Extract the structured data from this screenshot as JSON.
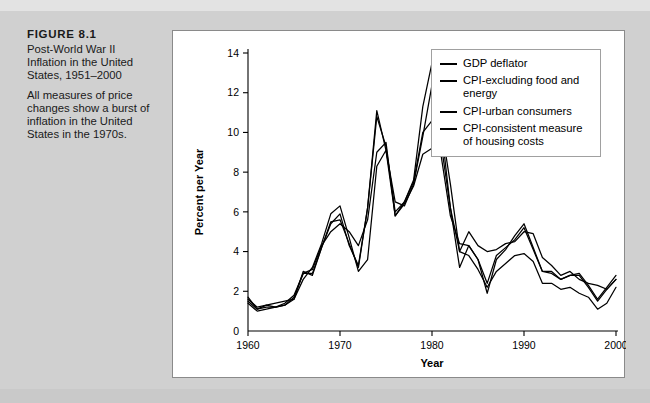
{
  "caption": {
    "figure_number": "FIGURE 8.1",
    "title": "Post-World War II Inflation in the United States, 1951–2000",
    "description": "All measures of price changes show a burst of inflation in the United States in the 1970s."
  },
  "chart_data": {
    "type": "line",
    "title": "",
    "xlabel": "Year",
    "ylabel": "Percent per Year",
    "xlim": [
      1960,
      2000
    ],
    "ylim": [
      0,
      14
    ],
    "xticks": [
      1960,
      1970,
      1980,
      1990,
      2000
    ],
    "yticks": [
      0,
      2,
      4,
      6,
      8,
      10,
      12,
      14
    ],
    "grid": false,
    "legend_position": "top-right",
    "x": [
      1960,
      1961,
      1962,
      1963,
      1964,
      1965,
      1966,
      1967,
      1968,
      1969,
      1970,
      1971,
      1972,
      1973,
      1974,
      1975,
      1976,
      1977,
      1978,
      1979,
      1980,
      1981,
      1982,
      1983,
      1984,
      1985,
      1986,
      1987,
      1988,
      1989,
      1990,
      1991,
      1992,
      1993,
      1994,
      1995,
      1996,
      1997,
      1998,
      1999,
      2000
    ],
    "series": [
      {
        "name": "GDP deflator",
        "values": [
          1.7,
          1.1,
          1.3,
          1.2,
          1.4,
          1.8,
          2.9,
          3.1,
          4.3,
          5.0,
          5.4,
          5.0,
          4.3,
          5.6,
          9.0,
          9.5,
          5.8,
          6.4,
          7.3,
          8.9,
          9.2,
          9.4,
          6.2,
          4.0,
          3.8,
          3.1,
          2.2,
          3.0,
          3.4,
          3.8,
          3.9,
          3.5,
          2.4,
          2.4,
          2.1,
          2.2,
          1.9,
          1.7,
          1.1,
          1.4,
          2.2
        ]
      },
      {
        "name": "CPI-excluding food and energy",
        "values": [
          1.6,
          1.2,
          1.3,
          1.4,
          1.5,
          1.6,
          2.6,
          3.2,
          4.4,
          5.9,
          6.3,
          4.7,
          3.0,
          3.6,
          8.3,
          9.1,
          6.5,
          6.3,
          7.4,
          9.8,
          12.4,
          10.4,
          7.4,
          4.0,
          5.0,
          4.3,
          4.0,
          4.1,
          4.4,
          4.5,
          5.0,
          4.9,
          3.7,
          3.3,
          2.8,
          3.0,
          2.6,
          2.4,
          2.3,
          2.1,
          2.6
        ]
      },
      {
        "name": "CPI-urban consumers",
        "values": [
          1.5,
          1.1,
          1.2,
          1.2,
          1.3,
          1.6,
          3.0,
          2.8,
          4.2,
          5.4,
          5.9,
          4.3,
          3.3,
          6.2,
          11.1,
          9.1,
          5.8,
          6.5,
          7.6,
          11.3,
          13.5,
          10.3,
          6.2,
          3.2,
          4.3,
          3.6,
          1.9,
          3.6,
          4.1,
          4.8,
          5.4,
          4.2,
          3.0,
          3.0,
          2.6,
          2.8,
          2.9,
          2.3,
          1.6,
          2.2,
          2.8
        ]
      },
      {
        "name": "CPI-consistent measure of housing costs",
        "values": [
          1.4,
          1.0,
          1.1,
          1.2,
          1.3,
          1.7,
          2.9,
          2.9,
          4.2,
          5.5,
          5.6,
          4.4,
          3.2,
          6.2,
          10.8,
          9.3,
          6.0,
          6.5,
          7.5,
          10.0,
          10.6,
          8.8,
          5.8,
          4.4,
          4.3,
          3.6,
          2.4,
          3.8,
          4.2,
          4.6,
          5.2,
          4.1,
          3.0,
          2.9,
          2.6,
          2.8,
          2.8,
          2.2,
          1.5,
          2.1,
          2.6
        ]
      }
    ]
  },
  "legend": {
    "items": [
      "GDP deflator",
      "CPI-excluding food and energy",
      "CPI-urban consumers",
      "CPI-consistent measure of housing costs"
    ]
  }
}
